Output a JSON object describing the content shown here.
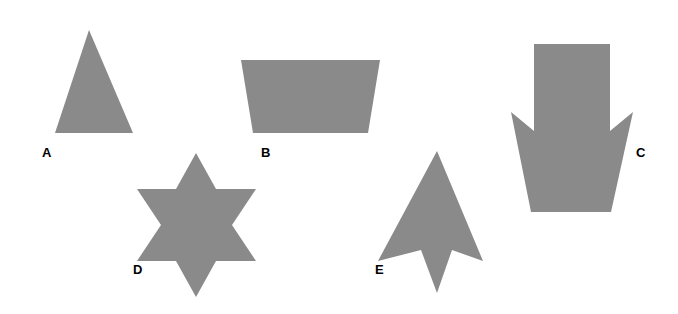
{
  "figure": {
    "width": 678,
    "height": 314,
    "background_color": "#ffffff",
    "shape_fill_color": "#8a8a8a",
    "label_color": "#000000"
  },
  "shapes": [
    {
      "id": "shape-a",
      "label": "A",
      "name": "triangle",
      "icon_name": "triangle-shape",
      "fill": "#8a8a8a",
      "points": "89,30 133,133 55,133",
      "label_position": {
        "x": 42,
        "y": 146
      }
    },
    {
      "id": "shape-b",
      "label": "B",
      "name": "trapezoid",
      "icon_name": "trapezoid-shape",
      "fill": "#8a8a8a",
      "points": "241,60 380,60 368,133 253,133",
      "label_position": {
        "x": 261,
        "y": 146
      }
    },
    {
      "id": "shape-c",
      "label": "C",
      "name": "down-arrow-crown",
      "icon_name": "down-arrow-shape",
      "fill": "#8a8a8a",
      "points": "534,44 610,44 610,131 633,112 611,212 531,212 511,112 534,131",
      "label_position": {
        "x": 636,
        "y": 146
      }
    },
    {
      "id": "shape-d",
      "label": "D",
      "name": "six-pointed-star",
      "icon_name": "star-six-shape",
      "fill": "#8a8a8a",
      "points": "196,153 216,189 256,189 232,225 256,261 216,261 196,297 176,261 137,261 161,225 137,189 176,189",
      "label_position": {
        "x": 133,
        "y": 263
      }
    },
    {
      "id": "shape-e",
      "label": "E",
      "name": "up-arrow-dart",
      "icon_name": "up-arrow-dart-shape",
      "fill": "#8a8a8a",
      "points": "437,151 483,261 452,250 437,293 421,250 378,261",
      "label_position": {
        "x": 375,
        "y": 263
      }
    }
  ],
  "labels": {
    "a": "A",
    "b": "B",
    "c": "C",
    "d": "D",
    "e": "E"
  }
}
